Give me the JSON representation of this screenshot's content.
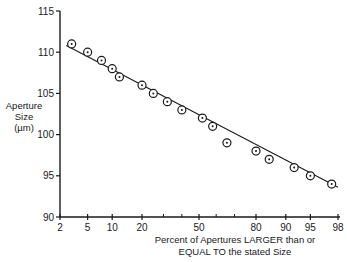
{
  "chart_data": {
    "type": "scatter",
    "title": "",
    "xlabel": "Percent of Apertures LARGER than or EQUAL TO the stated Size",
    "xlabel_lines": [
      "Percent of Apertures LARGER than or",
      "EQUAL TO the stated Size"
    ],
    "ylabel": "Aperture Size (µm)",
    "ylabel_lines": [
      "Aperture",
      "Size",
      "(µm)"
    ],
    "x_scale": "probability",
    "x_ticks": [
      2,
      5,
      10,
      20,
      50,
      80,
      90,
      95,
      98
    ],
    "x_minor_ticks": [
      30,
      40,
      60,
      70
    ],
    "y_ticks": [
      90,
      95,
      100,
      105,
      110,
      115
    ],
    "ylim": [
      90,
      115
    ],
    "xlim": [
      2,
      98
    ],
    "grid": false,
    "legend": null,
    "series": [
      {
        "name": "Measured apertures",
        "marker": "circle-dot",
        "x": [
          3,
          5,
          7.5,
          10,
          12,
          20,
          25,
          32,
          40,
          52,
          58,
          66,
          80,
          85,
          92,
          95,
          97.5
        ],
        "y": [
          111,
          110,
          109,
          108,
          107,
          106,
          105,
          104,
          103,
          102,
          101,
          99,
          98,
          97,
          96,
          95,
          94
        ]
      },
      {
        "name": "Fitted line",
        "type": "line",
        "x": [
          2.5,
          98
        ],
        "y": [
          110.8,
          93.6
        ]
      }
    ]
  }
}
